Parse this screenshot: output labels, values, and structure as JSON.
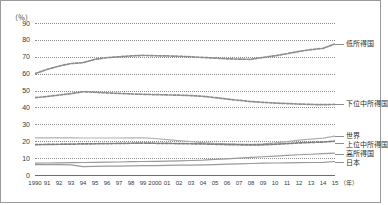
{
  "chart_data": {
    "type": "line",
    "title": "",
    "xlabel": "年",
    "ylabel": "（％）",
    "ylim": [
      0,
      90
    ],
    "yticks": [
      0,
      10,
      20,
      30,
      40,
      50,
      60,
      70,
      80,
      90
    ],
    "grid": true,
    "legend_position": "right-inline",
    "x": [
      1990,
      1991,
      1992,
      1993,
      1994,
      1995,
      1996,
      1997,
      1998,
      1999,
      2000,
      2001,
      2002,
      2003,
      2004,
      2005,
      2006,
      2007,
      2008,
      2009,
      2010,
      2011,
      2012,
      2013,
      2014,
      2015
    ],
    "xtick_labels": [
      "1990",
      "91",
      "92",
      "93",
      "94",
      "95",
      "96",
      "97",
      "98",
      "99",
      "2000",
      "01",
      "02",
      "03",
      "04",
      "05",
      "06",
      "07",
      "08",
      "09",
      "10",
      "11",
      "12",
      "13",
      "14",
      "15"
    ],
    "series": [
      {
        "name": "低所得国",
        "style": "dashed",
        "color": "#8d8d8d",
        "values": [
          60.0,
          62.5,
          64.5,
          66.0,
          66.5,
          68.5,
          69.5,
          70.0,
          70.5,
          70.8,
          70.6,
          70.5,
          70.3,
          70.0,
          69.6,
          69.2,
          68.8,
          68.6,
          68.5,
          69.6,
          70.6,
          71.8,
          73.2,
          74.2,
          75.0,
          77.6
        ]
      },
      {
        "name": "下位中所得国",
        "style": "dashed",
        "color": "#8d8d8d",
        "values": [
          45.8,
          46.5,
          47.3,
          48.2,
          49.3,
          49.0,
          48.6,
          48.3,
          48.0,
          47.8,
          47.6,
          47.4,
          47.3,
          47.0,
          46.6,
          45.8,
          45.0,
          44.2,
          43.5,
          43.0,
          42.6,
          42.3,
          42.0,
          41.8,
          41.6,
          41.8
        ]
      },
      {
        "name": "世界",
        "style": "solid",
        "color": "#b0b0b0",
        "values": [
          22.0,
          22.0,
          22.0,
          22.0,
          21.9,
          21.9,
          21.9,
          21.9,
          22.0,
          22.0,
          21.6,
          21.0,
          20.4,
          19.8,
          19.2,
          18.8,
          18.5,
          18.3,
          18.2,
          18.4,
          19.0,
          19.8,
          20.6,
          21.3,
          21.8,
          23.0
        ]
      },
      {
        "name": "上位中所得国",
        "style": "dashed",
        "color": "#7f7f7f",
        "values": [
          18.0,
          18.1,
          18.2,
          18.3,
          18.4,
          18.5,
          18.6,
          18.7,
          18.8,
          18.9,
          18.8,
          18.7,
          18.6,
          18.5,
          18.4,
          18.2,
          18.0,
          17.9,
          17.8,
          17.9,
          18.2,
          18.6,
          19.0,
          19.3,
          19.5,
          20.0
        ]
      },
      {
        "name": "高所得国",
        "style": "solid",
        "color": "#9a9a9a",
        "values": [
          7.0,
          7.1,
          7.2,
          7.3,
          7.4,
          7.5,
          7.6,
          7.7,
          7.9,
          8.0,
          8.1,
          8.2,
          8.4,
          8.6,
          8.8,
          9.2,
          9.6,
          10.0,
          10.4,
          10.8,
          11.2,
          11.6,
          12.0,
          12.3,
          12.6,
          13.0
        ]
      },
      {
        "name": "日本",
        "style": "solid",
        "color": "#9a9a9a",
        "values": [
          6.2,
          6.2,
          6.1,
          6.0,
          5.0,
          5.1,
          5.2,
          5.3,
          5.4,
          5.5,
          5.6,
          5.7,
          5.8,
          5.9,
          6.0,
          6.2,
          6.4,
          6.6,
          6.8,
          7.0,
          7.1,
          7.2,
          7.3,
          7.4,
          7.5,
          8.0
        ]
      }
    ]
  },
  "labels": {
    "y_unit": "（％）",
    "x_unit": "（年）"
  }
}
